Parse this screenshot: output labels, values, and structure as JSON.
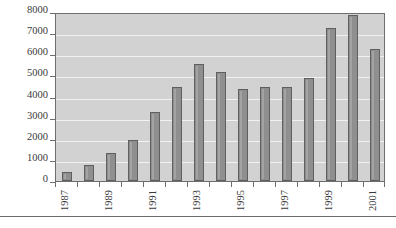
{
  "chart_data": {
    "type": "bar",
    "title": "",
    "subtitle": "",
    "xlabel": "",
    "ylabel": "",
    "categories": [
      "1987",
      "1988",
      "1989",
      "1990",
      "1991",
      "1992",
      "1993",
      "1994",
      "1995",
      "1996",
      "1997",
      "1998",
      "1999",
      "2000",
      "2001"
    ],
    "values": [
      430,
      760,
      1320,
      1920,
      3280,
      4470,
      5540,
      5150,
      4340,
      4430,
      4470,
      4900,
      7240,
      7880,
      6230
    ],
    "series": [
      {
        "name": "",
        "values": [
          430,
          760,
          1320,
          1920,
          3280,
          4470,
          5540,
          5150,
          4340,
          4430,
          4470,
          4900,
          7240,
          7880,
          6230
        ]
      }
    ],
    "ylim": [
      0,
      8000
    ],
    "yticks": [
      0,
      1000,
      2000,
      3000,
      4000,
      5000,
      6000,
      7000,
      8000
    ],
    "ytick_labels": [
      "0",
      "1000",
      "2000",
      "3000",
      "4000",
      "5000",
      "6000",
      "7000",
      "8000"
    ],
    "xtick_labels": [
      "1987",
      "1989",
      "1991",
      "1993",
      "1995",
      "1997",
      "1999",
      "2001"
    ],
    "xtick_label_rotation": 90,
    "grid": true,
    "grid_axis": "y",
    "grid_color": "#f2f2f2",
    "legend": false,
    "legend_position": "none",
    "bar_color": "#8f8f8f",
    "bar_edge_color": "#5f5f5f",
    "plot_background": "#d2d2d2",
    "figure_background": "#ffffff",
    "axis_color": "#6e6e6e",
    "tick_label_color": "#3a3a3a",
    "annotations": []
  },
  "figure": {
    "bottom_rule_color": "#6b6b6b"
  }
}
